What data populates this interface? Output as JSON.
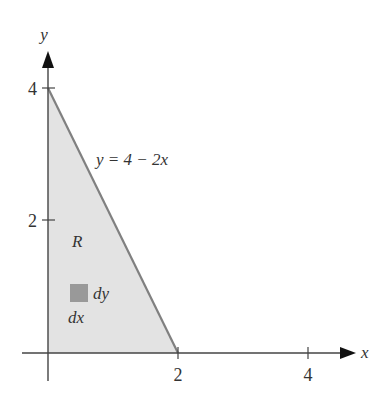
{
  "diagram": {
    "type": "region-of-integration",
    "region_label": "R",
    "curve_label": "y = 4 − 2x",
    "element_labels": {
      "dx": "dx",
      "dy": "dy"
    },
    "axes": {
      "x_label": "x",
      "y_label": "y",
      "x_ticks": [
        {
          "value": 2,
          "label": "2"
        },
        {
          "value": 4,
          "label": "4"
        }
      ],
      "y_ticks": [
        {
          "value": 2,
          "label": "2"
        },
        {
          "value": 4,
          "label": "4"
        }
      ]
    },
    "region_vertices": [
      [
        0,
        0
      ],
      [
        0,
        4
      ],
      [
        2,
        0
      ]
    ],
    "colors": {
      "region_fill": "#e3e3e3",
      "boundary_line": "#808080",
      "axis": "#333333",
      "element_square": "#999999"
    }
  }
}
